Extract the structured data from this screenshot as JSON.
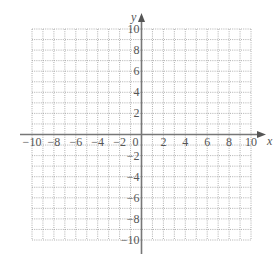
{
  "chart_data": {
    "type": "scatter",
    "title": "",
    "xlabel": "x",
    "ylabel": "y",
    "xlim": [
      -10,
      10
    ],
    "ylim": [
      -10,
      10
    ],
    "grid": true,
    "grid_style": "dotted",
    "grid_step": 1,
    "x_ticks": [
      -10,
      -8,
      -6,
      -4,
      -2,
      0,
      2,
      4,
      6,
      8,
      10
    ],
    "x_tick_labels": [
      "−10",
      "−8",
      "−6",
      "−4",
      "−2",
      "0",
      "2",
      "4",
      "6",
      "8",
      "10"
    ],
    "y_ticks": [
      10,
      8,
      6,
      4,
      2,
      -2,
      -4,
      -6,
      -8,
      -10
    ],
    "y_tick_labels": [
      "10",
      "8",
      "6",
      "4",
      "2",
      "−2",
      "−4",
      "−6",
      "−8",
      "−10"
    ],
    "series": [],
    "legend": null,
    "colors": {
      "axis": "#777777",
      "grid": "#9a9a9a",
      "text": "#555555"
    }
  }
}
